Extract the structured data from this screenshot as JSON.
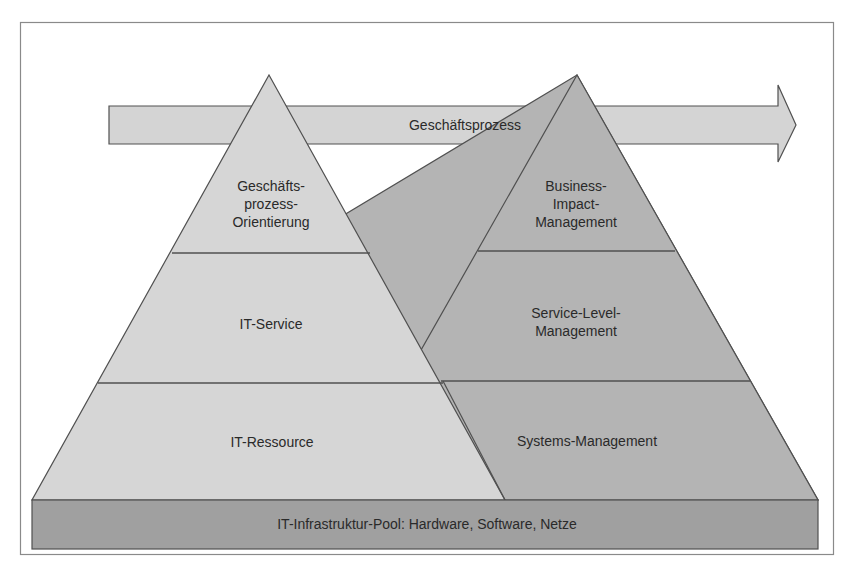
{
  "diagram": {
    "type": "two-pyramid-layer-model",
    "colors": {
      "background": "#ffffff",
      "frame": "#8a8a8a",
      "left_pyramid_fill": "#d6d6d6",
      "right_pyramid_fill": "#b4b4b4",
      "arrow_fill": "#d4d4d4",
      "base_fill": "#a0a0a0",
      "stroke": "#505050",
      "text": "#2a2a2a"
    },
    "process_arrow": {
      "label": "Geschäftsprozess"
    },
    "left_pyramid": {
      "layers": [
        {
          "label_lines": [
            "Geschäfts-",
            "prozess-",
            "Orientierung"
          ]
        },
        {
          "label_lines": [
            "IT-Service"
          ]
        },
        {
          "label_lines": [
            "IT-Ressource"
          ]
        }
      ]
    },
    "right_pyramid": {
      "layers": [
        {
          "label_lines": [
            "Business-",
            "Impact-",
            "Management"
          ]
        },
        {
          "label_lines": [
            "Service-Level-",
            "Management"
          ]
        },
        {
          "label_lines": [
            "Systems-Management"
          ]
        }
      ]
    },
    "base": {
      "label": "IT-Infrastruktur-Pool: Hardware, Software, Netze"
    }
  }
}
